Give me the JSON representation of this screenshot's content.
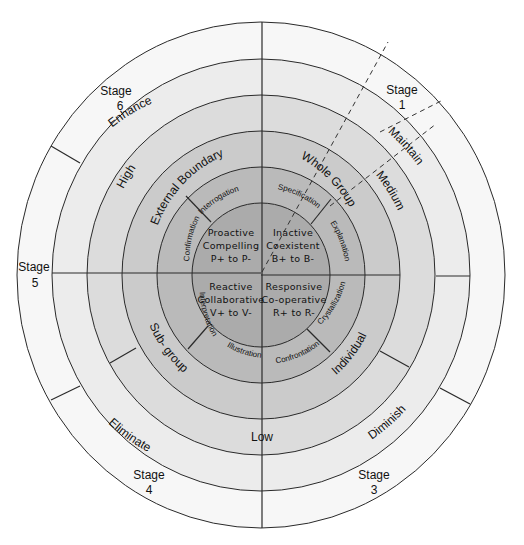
{
  "diagram": {
    "title": "",
    "center": {
      "x": 261,
      "y": 275
    },
    "rings": [
      {
        "name": "core",
        "rx": 69,
        "ry": 72,
        "fill": "#a9a9a9"
      },
      {
        "name": "behaviour",
        "rx": 104,
        "ry": 108,
        "fill": "#b8b8b8"
      },
      {
        "name": "group",
        "rx": 139,
        "ry": 144,
        "fill": "#c9c9c9"
      },
      {
        "name": "level",
        "rx": 174,
        "ry": 180,
        "fill": "#dadada"
      },
      {
        "name": "action",
        "rx": 209,
        "ry": 216,
        "fill": "#ebebeb"
      },
      {
        "name": "stage",
        "rx": 244,
        "ry": 253,
        "fill": "#f7f7f7"
      }
    ],
    "core": {
      "top_left": {
        "line1": "Proactive",
        "line2": "Compelling",
        "line3": "P+ to P-"
      },
      "top_right": {
        "line1": "Inactive",
        "line2": "Coexistent",
        "line3": "B+ to B-"
      },
      "bottom_left": {
        "line1": "Reactive",
        "line2": "Collaborative",
        "line3": "V+ to V-"
      },
      "bottom_right": {
        "line1": "Responsive",
        "line2": "Co-operative",
        "line3": "R+ to R-"
      }
    },
    "behaviour_ring": {
      "interrogation": "Interrogation",
      "confirmation": "Confirmation",
      "specification": "Specification",
      "explanation": "Explanation",
      "interpretation": "Interpretation",
      "illustration": "Illustration",
      "confrontation": "Confrontation",
      "crystallization": "Crystallization"
    },
    "group_ring": {
      "external_boundary": "External Boundary",
      "whole_group": "Whole Group",
      "sub_group": "Sub- group",
      "individual": "Individual"
    },
    "level_ring": {
      "high": "High",
      "medium": "Medium",
      "low": "Low"
    },
    "action_ring": {
      "enhance": "Enhance",
      "maintain": "Maintain",
      "diminish": "Diminish",
      "eliminate": "Eliminate"
    },
    "stage_ring": {
      "stage1": {
        "word": "Stage",
        "num": "1"
      },
      "stage3": {
        "word": "Stage",
        "num": "3"
      },
      "stage4": {
        "word": "Stage",
        "num": "4"
      },
      "stage5": {
        "word": "Stage",
        "num": "5"
      },
      "stage6": {
        "word": "Stage",
        "num": "6"
      }
    }
  }
}
